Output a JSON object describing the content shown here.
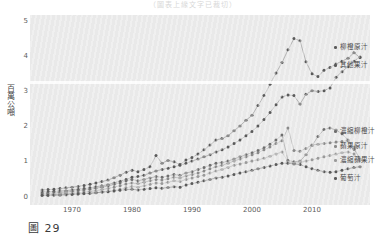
{
  "figure": {
    "caption": "圖 29",
    "top_cut_text": "（圖表上緣文字已裁切）"
  },
  "axes": {
    "y_axis_title": "百萬公噸",
    "y_ticks": [
      "0",
      "1",
      "2",
      "3",
      "4",
      "5"
    ],
    "x_ticks": [
      "1970",
      "1980",
      "1990",
      "2000",
      "2010"
    ]
  },
  "legend": {
    "items": [
      {
        "label": "柳橙原汁",
        "color": "#5a5a5a"
      },
      {
        "label": "其他果汁",
        "color": "#5a5a5a"
      },
      {
        "label": "濃縮柳橙汁",
        "color": "#6e6e6e"
      },
      {
        "label": "蘋果原汁",
        "color": "#8a8a8a"
      },
      {
        "label": "濃縮蘋果汁",
        "color": "#9a9a9a"
      },
      {
        "label": "葡萄汁",
        "color": "#5a5a5a"
      }
    ]
  },
  "colors": {
    "panel_background": "#e9e9e9",
    "tick_text": "#5c5c5c",
    "series_dark": "#5a5a5a",
    "series_mid": "#7d7d7d",
    "series_light": "#a2a2a2"
  },
  "chart_data": {
    "type": "line",
    "title": "",
    "subtitle": "",
    "xlabel": "",
    "ylabel": "百萬公噸",
    "xlim": [
      1964,
      2019
    ],
    "ylim": [
      0,
      5
    ],
    "grid": false,
    "legend_position": "right",
    "marker": "filled-circle",
    "x": [
      1965,
      1966,
      1967,
      1968,
      1969,
      1970,
      1971,
      1972,
      1973,
      1974,
      1975,
      1976,
      1977,
      1978,
      1979,
      1980,
      1981,
      1982,
      1983,
      1984,
      1985,
      1986,
      1987,
      1988,
      1989,
      1990,
      1991,
      1992,
      1993,
      1994,
      1995,
      1996,
      1997,
      1998,
      1999,
      2000,
      2001,
      2002,
      2003,
      2004,
      2005,
      2006,
      2007,
      2008,
      2009,
      2010,
      2011,
      2012,
      2013,
      2014,
      2015,
      2016,
      2017,
      2018
    ],
    "series": [
      {
        "name": "柳橙原汁",
        "color": "#5a5a5a",
        "values": [
          0.2,
          0.21,
          0.22,
          0.24,
          0.26,
          0.28,
          0.3,
          0.33,
          0.36,
          0.4,
          0.44,
          0.48,
          0.55,
          0.62,
          0.7,
          0.76,
          0.72,
          0.78,
          0.86,
          1.18,
          0.96,
          1.04,
          1.0,
          0.92,
          1.05,
          1.12,
          1.22,
          1.34,
          1.48,
          1.62,
          1.66,
          1.74,
          1.88,
          2.02,
          2.18,
          2.32,
          2.6,
          2.88,
          3.2,
          3.52,
          3.82,
          4.18,
          4.5,
          4.44,
          3.84,
          3.5,
          3.42,
          3.6,
          3.68,
          3.78,
          3.86,
          3.94,
          4.1,
          3.96
        ]
      },
      {
        "name": "其他果汁",
        "color": "#5a5a5a",
        "values": [
          0.14,
          0.15,
          0.16,
          0.17,
          0.18,
          0.2,
          0.22,
          0.24,
          0.26,
          0.29,
          0.32,
          0.35,
          0.4,
          0.45,
          0.5,
          0.56,
          0.58,
          0.62,
          0.68,
          0.74,
          0.78,
          0.82,
          0.86,
          0.9,
          0.96,
          1.02,
          1.08,
          1.14,
          1.2,
          1.28,
          1.34,
          1.42,
          1.52,
          1.62,
          1.74,
          1.86,
          2.02,
          2.2,
          2.4,
          2.62,
          2.84,
          2.9,
          2.88,
          2.64,
          2.92,
          3.02,
          3.0,
          3.02,
          3.1,
          3.4,
          3.56,
          3.7,
          3.86,
          3.98
        ]
      },
      {
        "name": "濃縮柳橙汁",
        "color": "#6e6e6e",
        "values": [
          0.1,
          0.11,
          0.12,
          0.13,
          0.14,
          0.16,
          0.18,
          0.2,
          0.22,
          0.25,
          0.28,
          0.31,
          0.36,
          0.4,
          0.46,
          0.5,
          0.46,
          0.5,
          0.54,
          0.58,
          0.56,
          0.6,
          0.64,
          0.62,
          0.68,
          0.72,
          0.78,
          0.84,
          0.9,
          0.96,
          0.98,
          1.02,
          1.08,
          1.14,
          1.2,
          1.26,
          1.32,
          1.4,
          1.5,
          1.62,
          1.76,
          1.04,
          1.0,
          1.02,
          1.2,
          1.46,
          1.72,
          1.92,
          1.96,
          1.9,
          1.8,
          1.62,
          1.36,
          1.08
        ]
      },
      {
        "name": "蘋果原汁",
        "color": "#8a8a8a",
        "values": [
          0.06,
          0.07,
          0.08,
          0.09,
          0.1,
          0.11,
          0.12,
          0.14,
          0.16,
          0.18,
          0.21,
          0.24,
          0.28,
          0.32,
          0.37,
          0.4,
          0.38,
          0.42,
          0.46,
          0.5,
          0.48,
          0.52,
          0.56,
          0.54,
          0.6,
          0.64,
          0.68,
          0.74,
          0.8,
          0.86,
          0.9,
          0.96,
          1.02,
          1.08,
          1.14,
          1.2,
          1.26,
          1.34,
          1.42,
          1.52,
          1.6,
          1.96,
          1.32,
          1.3,
          1.38,
          1.48,
          1.5,
          1.52,
          1.54,
          1.56,
          1.58,
          1.6,
          1.42,
          1.06
        ]
      },
      {
        "name": "濃縮蘋果汁",
        "color": "#9a9a9a",
        "values": [
          0.04,
          0.04,
          0.05,
          0.05,
          0.06,
          0.07,
          0.08,
          0.09,
          0.1,
          0.12,
          0.14,
          0.16,
          0.19,
          0.22,
          0.26,
          0.3,
          0.28,
          0.32,
          0.36,
          0.4,
          0.38,
          0.42,
          0.46,
          0.44,
          0.5,
          0.54,
          0.58,
          0.62,
          0.68,
          0.74,
          0.78,
          0.84,
          0.9,
          0.94,
          0.98,
          1.02,
          1.06,
          1.1,
          1.16,
          1.22,
          1.28,
          1.0,
          0.96,
          0.98,
          1.02,
          1.06,
          1.1,
          1.14,
          1.18,
          1.22,
          1.26,
          1.28,
          1.22,
          1.04
        ]
      },
      {
        "name": "葡萄汁",
        "color": "#5a5a5a",
        "values": [
          0.05,
          0.05,
          0.06,
          0.06,
          0.07,
          0.08,
          0.09,
          0.1,
          0.11,
          0.12,
          0.14,
          0.15,
          0.17,
          0.19,
          0.21,
          0.22,
          0.2,
          0.22,
          0.24,
          0.26,
          0.25,
          0.27,
          0.29,
          0.28,
          0.34,
          0.38,
          0.42,
          0.46,
          0.5,
          0.54,
          0.56,
          0.6,
          0.64,
          0.68,
          0.72,
          0.76,
          0.8,
          0.84,
          0.88,
          0.92,
          0.96,
          0.96,
          0.94,
          0.92,
          0.86,
          0.8,
          0.76,
          0.72,
          0.7,
          0.72,
          0.76,
          0.8,
          0.84,
          0.86
        ]
      }
    ]
  }
}
